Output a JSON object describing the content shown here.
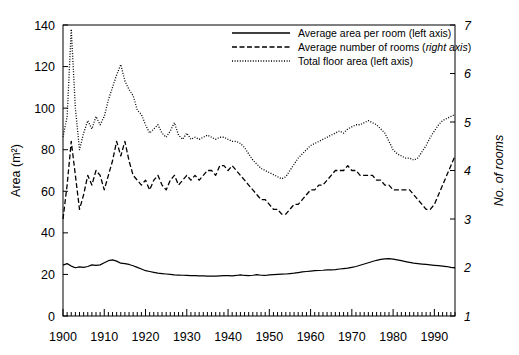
{
  "chart_data": {
    "type": "line",
    "title": "",
    "xlabel": "",
    "ylabel": "Area (m²)",
    "y2label": "No. of rooms",
    "xlim": [
      1900,
      1995
    ],
    "ylim": [
      0,
      140
    ],
    "y2lim": [
      1,
      7
    ],
    "grid": false,
    "legend_position": "top-right",
    "xticks": [
      1900,
      1910,
      1920,
      1930,
      1940,
      1950,
      1960,
      1970,
      1980,
      1990
    ],
    "xticklabels": [
      "1900",
      "1910",
      "1920",
      "1930",
      "1940",
      "1950",
      "1960",
      "1970",
      "1980",
      "1990"
    ],
    "yticks": [
      0,
      20,
      40,
      60,
      80,
      100,
      120,
      140
    ],
    "yticklabels": [
      "0",
      "20",
      "40",
      "60",
      "80",
      "100",
      "120",
      "140"
    ],
    "y2ticks": [
      1,
      2,
      3,
      4,
      5,
      6,
      7
    ],
    "y2ticklabels": [
      "1",
      "2",
      "3",
      "4",
      "5",
      "6",
      "7"
    ],
    "minor_xtick_interval": 1,
    "x": [
      1900,
      1901,
      1902,
      1903,
      1904,
      1905,
      1906,
      1907,
      1908,
      1909,
      1910,
      1911,
      1912,
      1913,
      1914,
      1915,
      1916,
      1917,
      1918,
      1919,
      1920,
      1921,
      1922,
      1923,
      1924,
      1925,
      1926,
      1927,
      1928,
      1929,
      1930,
      1931,
      1932,
      1933,
      1934,
      1935,
      1936,
      1937,
      1938,
      1939,
      1940,
      1941,
      1942,
      1943,
      1944,
      1945,
      1946,
      1947,
      1948,
      1949,
      1950,
      1951,
      1952,
      1953,
      1954,
      1955,
      1956,
      1957,
      1958,
      1959,
      1960,
      1961,
      1962,
      1963,
      1964,
      1965,
      1966,
      1967,
      1968,
      1969,
      1970,
      1971,
      1972,
      1973,
      1974,
      1975,
      1976,
      1977,
      1978,
      1979,
      1980,
      1981,
      1982,
      1983,
      1984,
      1985,
      1986,
      1987,
      1988,
      1989,
      1990,
      1991,
      1992,
      1993,
      1994,
      1995
    ],
    "series": [
      {
        "name": "Average area per room (left axis)",
        "axis": "left",
        "style": "solid",
        "units": "m²",
        "values": [
          24.5,
          25.2,
          24.0,
          23.2,
          23.6,
          23.4,
          23.8,
          24.6,
          24.4,
          24.6,
          25.6,
          26.6,
          27.0,
          26.4,
          25.4,
          25.2,
          24.8,
          24.2,
          23.4,
          22.6,
          21.8,
          21.4,
          21.0,
          20.6,
          20.4,
          20.2,
          20.0,
          19.8,
          19.7,
          19.6,
          19.5,
          19.4,
          19.4,
          19.3,
          19.3,
          19.2,
          19.2,
          19.2,
          19.3,
          19.4,
          19.4,
          19.3,
          19.5,
          19.8,
          19.5,
          19.4,
          19.6,
          19.9,
          19.6,
          19.5,
          19.8,
          19.9,
          20.0,
          20.1,
          20.2,
          20.4,
          20.6,
          20.9,
          21.2,
          21.4,
          21.6,
          21.8,
          21.9,
          22.0,
          22.2,
          22.2,
          22.3,
          22.6,
          22.8,
          23.0,
          23.4,
          23.8,
          24.4,
          25.0,
          25.6,
          26.2,
          26.8,
          27.2,
          27.5,
          27.6,
          27.4,
          27.0,
          26.6,
          26.2,
          25.8,
          25.4,
          25.2,
          25.0,
          24.8,
          24.6,
          24.4,
          24.2,
          24.0,
          23.8,
          23.4,
          23.2
        ]
      },
      {
        "name": "Average number of rooms (right axis)",
        "axis": "right",
        "style": "dashed",
        "units": "rooms",
        "values": [
          3.0,
          3.7,
          4.6,
          3.9,
          3.2,
          3.5,
          3.9,
          3.7,
          4.0,
          3.9,
          3.6,
          3.9,
          4.2,
          4.6,
          4.3,
          4.6,
          4.2,
          3.9,
          3.8,
          3.7,
          3.8,
          3.6,
          3.8,
          3.9,
          3.7,
          3.6,
          3.8,
          3.9,
          3.7,
          3.8,
          3.9,
          3.8,
          3.9,
          3.8,
          3.9,
          4.0,
          4.0,
          3.9,
          4.1,
          4.1,
          4.0,
          4.1,
          4.0,
          3.9,
          3.8,
          3.7,
          3.6,
          3.5,
          3.4,
          3.4,
          3.3,
          3.2,
          3.2,
          3.1,
          3.1,
          3.2,
          3.3,
          3.3,
          3.4,
          3.5,
          3.6,
          3.6,
          3.7,
          3.7,
          3.8,
          3.9,
          4.0,
          4.0,
          4.0,
          4.1,
          4.0,
          4.0,
          3.9,
          3.9,
          3.9,
          3.9,
          3.8,
          3.8,
          3.7,
          3.7,
          3.6,
          3.6,
          3.6,
          3.6,
          3.6,
          3.5,
          3.4,
          3.3,
          3.2,
          3.2,
          3.3,
          3.5,
          3.7,
          3.9,
          4.1,
          4.3
        ]
      },
      {
        "name": "Total floor area (left axis)",
        "axis": "left",
        "style": "dotted",
        "units": "m²",
        "values": [
          86,
          96,
          138,
          100,
          80,
          88,
          94,
          90,
          96,
          92,
          96,
          104,
          110,
          116,
          121,
          113,
          109,
          106,
          99,
          97,
          92,
          88,
          90,
          92,
          88,
          86,
          89,
          93,
          87,
          85,
          88,
          85,
          86,
          85,
          86,
          87,
          86,
          85,
          86,
          86,
          85,
          84,
          84,
          83,
          81,
          78,
          75,
          73,
          71,
          70,
          69,
          68,
          67,
          66,
          67,
          70,
          73,
          76,
          78,
          80,
          82,
          83,
          84,
          85,
          86,
          87,
          88,
          89,
          88,
          90,
          91,
          92,
          92,
          93,
          94,
          93,
          92,
          90,
          88,
          84,
          80,
          78,
          77,
          76,
          76,
          75,
          76,
          79,
          82,
          86,
          89,
          92,
          94,
          95,
          96,
          97
        ]
      }
    ]
  },
  "legend": {
    "entries": [
      {
        "label_plain": "Average area per room (left axis)",
        "style": "solid"
      },
      {
        "label_pre": "Average number of rooms (",
        "label_italic": "right axis",
        "label_post": ")",
        "style": "dashed"
      },
      {
        "label_plain": "Total floor area (left axis)",
        "style": "dotted"
      }
    ]
  }
}
